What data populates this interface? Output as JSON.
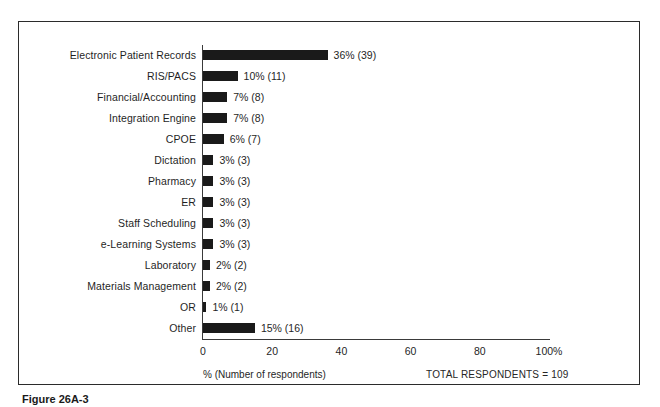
{
  "figure": {
    "caption": "Figure 26A-3"
  },
  "footer": {
    "axis_caption": "% (Number of respondents)",
    "total_respondents": "TOTAL RESPONDENTS = 109"
  },
  "chart_data": {
    "type": "bar",
    "orientation": "horizontal",
    "title": "",
    "xlabel": "% (Number of respondents)",
    "ylabel": "",
    "xlim": [
      0,
      100
    ],
    "grid": false,
    "legend": null,
    "bar_color": "#1a1a1a",
    "total_respondents": 109,
    "categories": [
      "Electronic Patient Records",
      "RIS/PACS",
      "Financial/Accounting",
      "Integration Engine",
      "CPOE",
      "Dictation",
      "Pharmacy",
      "ER",
      "Staff Scheduling",
      "e-Learning Systems",
      "Laboratory",
      "Materials Management",
      "OR",
      "Other"
    ],
    "values": [
      36,
      10,
      7,
      7,
      6,
      3,
      3,
      3,
      3,
      3,
      2,
      2,
      1,
      15
    ],
    "counts": [
      39,
      11,
      8,
      8,
      7,
      3,
      3,
      3,
      3,
      3,
      2,
      2,
      1,
      16
    ],
    "data_labels": [
      "36% (39)",
      "10% (11)",
      "7% (8)",
      "7% (8)",
      "6% (7)",
      "3% (3)",
      "3% (3)",
      "3% (3)",
      "3% (3)",
      "3% (3)",
      "2% (2)",
      "2% (2)",
      "1% (1)",
      "15% (16)"
    ],
    "xticks": [
      0,
      20,
      40,
      60,
      80,
      100
    ],
    "xtick_labels": [
      "0",
      "20",
      "40",
      "60",
      "80",
      "100%"
    ]
  }
}
